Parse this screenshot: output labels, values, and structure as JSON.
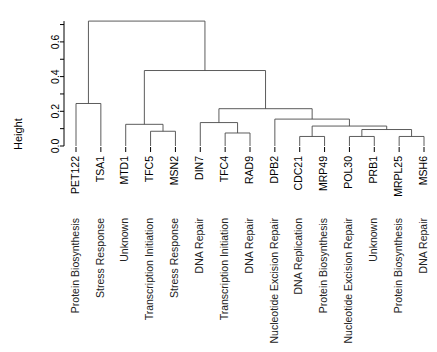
{
  "chart_data": {
    "type": "dendrogram",
    "title": "",
    "xlabel": "",
    "ylabel": "Height",
    "ylim": [
      0.0,
      0.72
    ],
    "grid": false,
    "legend": null,
    "y_ticks": [
      0.0,
      0.2,
      0.4,
      0.6
    ],
    "y_tick_labels": [
      "0.0",
      "0.2",
      "0.4",
      "0.6"
    ],
    "y_minor_ticks": [
      0.1,
      0.3,
      0.5,
      0.7
    ],
    "leaves": [
      {
        "gene": "PET122",
        "category": "Protein Biosynthesis"
      },
      {
        "gene": "TSA1",
        "category": "Stress Response"
      },
      {
        "gene": "MTD1",
        "category": "Unknown"
      },
      {
        "gene": "TFC5",
        "category": "Transcription Initiation"
      },
      {
        "gene": "MSN2",
        "category": "Stress Response"
      },
      {
        "gene": "DIN7",
        "category": "DNA Repair"
      },
      {
        "gene": "TFC4",
        "category": "Transcription Initiation"
      },
      {
        "gene": "RAD9",
        "category": "DNA Repair"
      },
      {
        "gene": "DPB2",
        "category": "Nucleotide Excision Repair"
      },
      {
        "gene": "CDC21",
        "category": "DNA Replication"
      },
      {
        "gene": "MRP49",
        "category": "Protein Biosynthesis"
      },
      {
        "gene": "POL30",
        "category": "Nucleotide Excision Repair"
      },
      {
        "gene": "PRB1",
        "category": "Unknown"
      },
      {
        "gene": "MRPL25",
        "category": "Protein Biosynthesis"
      },
      {
        "gene": "MSH6",
        "category": "DNA Repair"
      }
    ],
    "merges": [
      {
        "id": "m1",
        "left": {
          "leaf": 0
        },
        "right": {
          "leaf": 1
        },
        "height": 0.245
      },
      {
        "id": "m2",
        "left": {
          "leaf": 3
        },
        "right": {
          "leaf": 4
        },
        "height": 0.085
      },
      {
        "id": "m3",
        "left": {
          "leaf": 2
        },
        "right": {
          "node": "m2"
        },
        "height": 0.125
      },
      {
        "id": "m4",
        "left": {
          "leaf": 6
        },
        "right": {
          "leaf": 7
        },
        "height": 0.075
      },
      {
        "id": "m5",
        "left": {
          "leaf": 5
        },
        "right": {
          "node": "m4"
        },
        "height": 0.135
      },
      {
        "id": "m6",
        "left": {
          "leaf": 9
        },
        "right": {
          "leaf": 10
        },
        "height": 0.055
      },
      {
        "id": "m7",
        "left": {
          "leaf": 11
        },
        "right": {
          "leaf": 12
        },
        "height": 0.055
      },
      {
        "id": "m8",
        "left": {
          "leaf": 13
        },
        "right": {
          "leaf": 14
        },
        "height": 0.055
      },
      {
        "id": "m9",
        "left": {
          "node": "m7"
        },
        "right": {
          "node": "m8"
        },
        "height": 0.095
      },
      {
        "id": "m10",
        "left": {
          "node": "m6"
        },
        "right": {
          "node": "m9"
        },
        "height": 0.115
      },
      {
        "id": "m11",
        "left": {
          "leaf": 8
        },
        "right": {
          "node": "m10"
        },
        "height": 0.155
      },
      {
        "id": "m12",
        "left": {
          "node": "m5"
        },
        "right": {
          "node": "m11"
        },
        "height": 0.215
      },
      {
        "id": "m13",
        "left": {
          "node": "m3"
        },
        "right": {
          "node": "m12"
        },
        "height": 0.435
      },
      {
        "id": "m14",
        "left": {
          "node": "m1"
        },
        "right": {
          "node": "m13"
        },
        "height": 0.72
      }
    ]
  },
  "axis": {
    "y_label": "Height"
  }
}
